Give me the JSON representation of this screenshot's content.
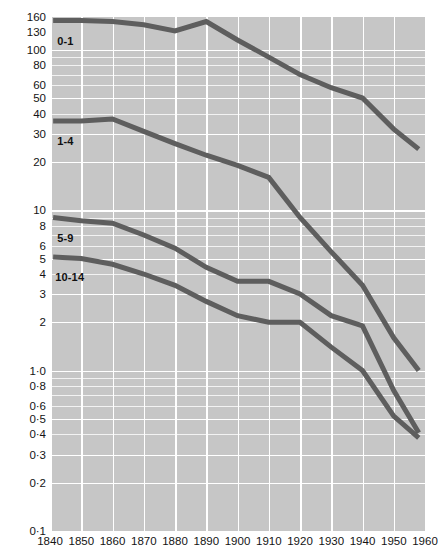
{
  "chart_data": {
    "type": "line",
    "title": "",
    "xlabel": "",
    "ylabel": "",
    "yscale": "log",
    "xlim": [
      1840,
      1960
    ],
    "ylim": [
      0.1,
      160
    ],
    "grid": true,
    "legend": "inline-labels",
    "x_ticks": [
      1840,
      1850,
      1860,
      1870,
      1880,
      1890,
      1900,
      1910,
      1920,
      1930,
      1940,
      1950,
      1960
    ],
    "y_ticks": [
      160,
      130,
      100,
      80,
      60,
      50,
      40,
      30,
      20,
      10,
      8,
      6,
      5,
      4,
      3,
      2,
      1.0,
      0.8,
      0.6,
      0.5,
      0.4,
      0.3,
      0.2,
      0.1
    ],
    "y_tick_labels": [
      "160",
      "130",
      "100",
      "80",
      "60",
      "50",
      "40",
      "30",
      "20",
      "10",
      "8",
      "6",
      "5",
      "4",
      "3",
      "2",
      "1·0",
      "0·8",
      "0·6",
      "0·5",
      "0·4",
      "0·3",
      "0·2",
      "0·1"
    ],
    "series": [
      {
        "name": "0-1",
        "label": "0-1",
        "color": "#5e5e5e",
        "x": [
          1841,
          1850,
          1860,
          1870,
          1880,
          1890,
          1900,
          1910,
          1920,
          1930,
          1940,
          1950,
          1958
        ],
        "values": [
          152,
          152,
          150,
          143,
          131,
          150,
          115,
          90,
          70,
          58,
          50,
          32,
          24
        ]
      },
      {
        "name": "1-4",
        "label": "1-4",
        "color": "#5e5e5e",
        "x": [
          1841,
          1850,
          1860,
          1870,
          1880,
          1890,
          1900,
          1910,
          1920,
          1930,
          1940,
          1950,
          1958
        ],
        "values": [
          36,
          36,
          37,
          31,
          26,
          22,
          19,
          16,
          9,
          5.5,
          3.4,
          1.6,
          1.0
        ]
      },
      {
        "name": "5-9",
        "label": "5-9",
        "color": "#5e5e5e",
        "x": [
          1841,
          1850,
          1860,
          1870,
          1880,
          1890,
          1900,
          1910,
          1920,
          1930,
          1940,
          1950,
          1958
        ],
        "values": [
          9.0,
          8.6,
          8.3,
          7.0,
          5.8,
          4.4,
          3.6,
          3.6,
          3.0,
          2.2,
          1.9,
          0.75,
          0.41
        ]
      },
      {
        "name": "10-14",
        "label": "10-14",
        "color": "#5e5e5e",
        "x": [
          1841,
          1850,
          1860,
          1870,
          1880,
          1890,
          1900,
          1910,
          1920,
          1930,
          1940,
          1950,
          1958
        ],
        "values": [
          5.1,
          5.0,
          4.6,
          4.0,
          3.4,
          2.7,
          2.2,
          2.0,
          2.0,
          1.4,
          1.0,
          0.52,
          0.38
        ]
      }
    ]
  },
  "chart": {
    "background_color": "#c6c6c6",
    "gridline_color": "#ffffff",
    "minor_gridline_color": "#f0f0f0",
    "line_color": "#5e5e5e",
    "axis_text_color": "#141414"
  }
}
